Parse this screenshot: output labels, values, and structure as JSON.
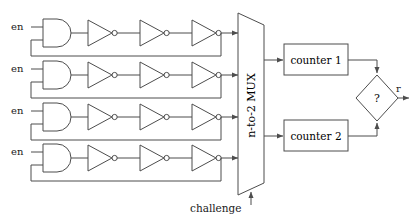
{
  "diagram": {
    "type": "block-diagram",
    "stroke_color": "#4d4d4d",
    "text_color": "#1a1a1a",
    "background": "#ffffff",
    "oscillator_rows": [
      {
        "id": "row-1",
        "enable_label": "en",
        "gate": "AND",
        "inverter_count": 3,
        "y": 33
      },
      {
        "id": "row-2",
        "enable_label": "en",
        "gate": "AND",
        "inverter_count": 3,
        "y": 75
      },
      {
        "id": "row-3",
        "enable_label": "en",
        "gate": "AND",
        "inverter_count": 3,
        "y": 117
      },
      {
        "id": "row-4",
        "enable_label": "en",
        "gate": "AND",
        "inverter_count": 3,
        "y": 158
      }
    ],
    "mux": {
      "label": "n-to-2 MUX",
      "inputs": 4,
      "outputs": 2
    },
    "challenge": {
      "label": "challenge"
    },
    "counters": [
      {
        "id": "counter-1",
        "label": "counter 1"
      },
      {
        "id": "counter-2",
        "label": "counter 2"
      }
    ],
    "comparator": {
      "label": "?",
      "shape": "diamond"
    },
    "response": {
      "label": "r"
    }
  }
}
